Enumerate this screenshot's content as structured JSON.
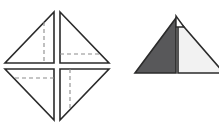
{
  "page": {
    "background_color": "#ffffff",
    "width": 219,
    "height": 130
  },
  "colors": {
    "stroke": "#2b2b2b",
    "dashed_stroke": "#8c8c8c",
    "fill_white": "#ffffff",
    "fill_dark_gray": "#58585a",
    "fill_light_gray": "#f2f2f2",
    "background": "#ffffff"
  },
  "figures": [
    {
      "id": "unfolded-square",
      "name": "unfolded-square-diagram",
      "label": "Unfolded square rotated 45 degrees, split into four right triangles with dashed fold lines",
      "shape": "diamond",
      "center": {
        "x": 57,
        "y": 66
      },
      "vertices": {
        "top": {
          "x": 57,
          "y": 10
        },
        "right": {
          "x": 112,
          "y": 66
        },
        "bottom": {
          "x": 57,
          "y": 122
        },
        "left": {
          "x": 3,
          "y": 66
        }
      },
      "gap": 3,
      "parts": [
        {
          "id": "triangle-top-left",
          "name": "triangle-top-left",
          "points": "54,12 54,63 5,63",
          "fill": "#ffffff",
          "dashed": {
            "type": "vertical",
            "x": 44,
            "y1": 22,
            "y2": 63
          }
        },
        {
          "id": "triangle-top-right",
          "name": "triangle-top-right",
          "points": "60,12 109,63 60,63",
          "fill": "#ffffff",
          "dashed": {
            "type": "horizontal",
            "y": 54,
            "x1": 60,
            "x2": 100
          }
        },
        {
          "id": "triangle-bottom-left",
          "name": "triangle-bottom-left",
          "points": "5,69 54,69 54,120",
          "fill": "#ffffff",
          "dashed": {
            "type": "horizontal",
            "y": 78,
            "x1": 15,
            "x2": 54
          }
        },
        {
          "id": "triangle-bottom-right",
          "name": "triangle-bottom-right",
          "points": "60,69 109,69 60,120",
          "fill": "#ffffff",
          "dashed": {
            "type": "vertical",
            "x": 70,
            "y1": 69,
            "y2": 110
          }
        }
      ]
    },
    {
      "id": "folded-triangle",
      "name": "folded-triangle-diagram",
      "label": "Folded result: large triangle with dark gray left half and light gray right half, small white notch at apex",
      "shape": "triangle",
      "apex": {
        "x": 176,
        "y": 18
      },
      "base_left": {
        "x": 135,
        "y": 73
      },
      "base_right_clipped": {
        "x": 219,
        "y": 73
      },
      "parts": [
        {
          "id": "half-dark",
          "name": "triangle-half-dark",
          "points": "176,18 176,73 135,73",
          "fill": "#58585a"
        },
        {
          "id": "half-light",
          "name": "triangle-half-light",
          "points": "178,20 224,73 178,73",
          "fill": "#f2f2f2"
        },
        {
          "id": "apex-notch",
          "name": "apex-notch-white",
          "points": "176,16 184,27 176,27",
          "fill": "#ffffff"
        }
      ]
    }
  ]
}
